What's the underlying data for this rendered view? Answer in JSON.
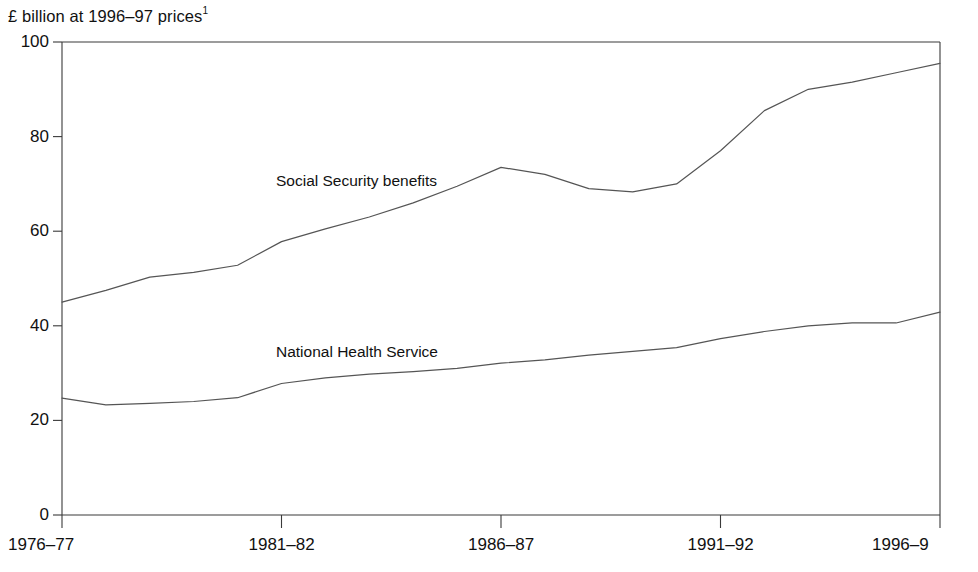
{
  "chart_data": {
    "type": "line",
    "title": "£ billion at 1996–97 prices",
    "title_footnote": "1",
    "xlabel": "",
    "ylabel": "",
    "ylim": [
      0,
      100
    ],
    "yticks": [
      0,
      20,
      40,
      60,
      80,
      100
    ],
    "ytick_labels": [
      "0",
      "20",
      "40",
      "60",
      "80",
      "100"
    ],
    "grid": false,
    "legend_position": "inline-labels",
    "x": [
      "1976–77",
      "1977–78",
      "1978–79",
      "1979–80",
      "1980–81",
      "1981–82",
      "1982–83",
      "1983–84",
      "1984–85",
      "1985–86",
      "1986–87",
      "1987–88",
      "1988–89",
      "1989–90",
      "1990–91",
      "1991–92",
      "1992–93",
      "1993–94",
      "1994–95",
      "1995–96",
      "1996–97"
    ],
    "xtick_labels": [
      "1976–77",
      "1981–82",
      "1986–87",
      "1991–92",
      "1996–9"
    ],
    "xtick_indices": [
      0,
      5,
      10,
      15,
      20
    ],
    "series": [
      {
        "name": "Social Security benefits",
        "color": "#555555",
        "values": [
          45.0,
          47.5,
          50.3,
          51.3,
          52.8,
          57.8,
          60.5,
          63.0,
          66.0,
          69.5,
          73.5,
          72.0,
          69.0,
          68.3,
          70.0,
          77.0,
          85.5,
          90.0,
          91.5,
          93.5,
          95.5
        ]
      },
      {
        "name": "National Health Service",
        "color": "#555555",
        "values": [
          24.7,
          23.3,
          23.6,
          24.0,
          24.8,
          27.8,
          29.0,
          29.8,
          30.3,
          31.0,
          32.1,
          32.8,
          33.8,
          34.6,
          35.4,
          37.3,
          38.8,
          40.0,
          40.6,
          40.6,
          42.9
        ]
      }
    ],
    "annotations": [
      {
        "text": "Social Security benefits",
        "x_px": 276,
        "y_px": 172
      },
      {
        "text": "National Health Service",
        "x_px": 276,
        "y_px": 343
      }
    ]
  },
  "plot_geometry": {
    "left_px": 62,
    "right_px": 940,
    "top_px": 42,
    "bottom_px": 515
  }
}
